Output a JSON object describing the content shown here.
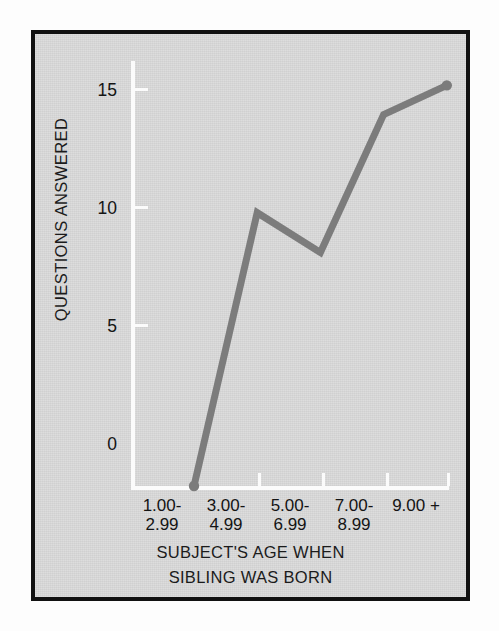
{
  "figure": {
    "plate_color": "#d9d9d9",
    "frame_color": "#111111",
    "axis_color": "#fbfbfb",
    "series_color": "#7c7c7c",
    "text_color": "#141414"
  },
  "chart_data": {
    "type": "line",
    "title": "",
    "subtitle": "",
    "xlabel_lines": [
      "SUBJECT'S AGE WHEN",
      "SIBLING WAS BORN"
    ],
    "xlabel": "SUBJECT'S AGE WHEN SIBLING WAS BORN",
    "ylabel": "QUESTIONS ANSWERED",
    "categories": [
      "1.00-2.99",
      "3.00-4.99",
      "5.00-6.99",
      "7.00-8.99",
      "9.00 +"
    ],
    "category_lines": [
      [
        "1.00-",
        "2.99"
      ],
      [
        "3.00-",
        "4.99"
      ],
      [
        "5.00-",
        "6.99"
      ],
      [
        "7.00-",
        "8.99"
      ],
      [
        "9.00 +",
        ""
      ]
    ],
    "values": [
      0.0,
      10.3,
      8.8,
      14.0,
      15.1
    ],
    "ytick_labels": [
      "15",
      "10",
      "5",
      "0"
    ],
    "ytick_values": [
      15,
      10,
      5,
      0
    ],
    "ylim": [
      0,
      16.4
    ],
    "xlim": [
      0,
      5
    ],
    "grid": false,
    "legend": false,
    "legend_position": "none",
    "markers": "endpoints-only",
    "line_width_px": 7
  },
  "axis": {
    "y_title": "QUESTIONS ANSWERED",
    "y_tick_0": "0",
    "y_tick_5": "5",
    "y_tick_10": "10",
    "y_tick_15": "15"
  },
  "xticks": [
    {
      "line1": "1.00-",
      "line2": "2.99"
    },
    {
      "line1": "3.00-",
      "line2": "4.99"
    },
    {
      "line1": "5.00-",
      "line2": "6.99"
    },
    {
      "line1": "7.00-",
      "line2": "8.99"
    },
    {
      "line1": "9.00 +",
      "line2": ""
    }
  ],
  "xtitle": {
    "line1": "SUBJECT'S AGE WHEN",
    "line2": "SIBLING WAS BORN"
  }
}
